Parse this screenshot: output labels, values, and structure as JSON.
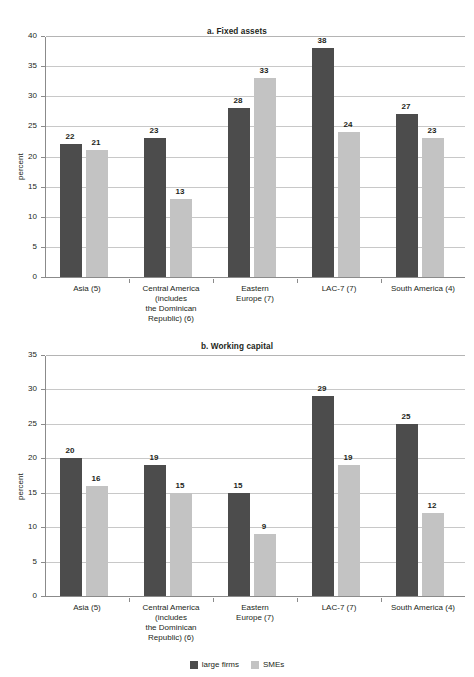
{
  "figure": {
    "panels": [
      {
        "id": "fixed-assets",
        "title": "a. Fixed assets",
        "ylabel": "percent"
      },
      {
        "id": "working-capital",
        "title": "b. Working capital",
        "ylabel": "percent"
      }
    ],
    "legend": {
      "items": [
        {
          "key": "large",
          "label": "large firms",
          "color": "#4c4c4c"
        },
        {
          "key": "sme",
          "label": "SMEs",
          "color": "#c3c3c3"
        }
      ]
    }
  },
  "chart_data": [
    {
      "type": "bar",
      "title": "a. Fixed assets",
      "xlabel": "",
      "ylabel": "percent",
      "ylim": [
        0,
        40
      ],
      "yticks": [
        0,
        5,
        10,
        15,
        20,
        25,
        30,
        35,
        40
      ],
      "grid": true,
      "legend_position": "bottom",
      "categories": [
        "Asia (5)",
        "Central America (includes the Dominican Republic) (6)",
        "Eastern Europe (7)",
        "LAC-7 (7)",
        "South America (4)"
      ],
      "category_lines": [
        [
          "Asia (5)"
        ],
        [
          "Central America",
          "(includes",
          "the Dominican",
          "Republic) (6)"
        ],
        [
          "Eastern",
          "Europe (7)"
        ],
        [
          "LAC-7 (7)"
        ],
        [
          "South America (4)"
        ]
      ],
      "series": [
        {
          "name": "large firms",
          "color": "#4c4c4c",
          "values": [
            22,
            23,
            28,
            38,
            27
          ]
        },
        {
          "name": "SMEs",
          "color": "#c3c3c3",
          "values": [
            21,
            13,
            33,
            24,
            23
          ]
        }
      ]
    },
    {
      "type": "bar",
      "title": "b. Working capital",
      "xlabel": "",
      "ylabel": "percent",
      "ylim": [
        0,
        35
      ],
      "yticks": [
        0,
        5,
        10,
        15,
        20,
        25,
        30,
        35
      ],
      "grid": true,
      "legend_position": "bottom",
      "categories": [
        "Asia (5)",
        "Central America (includes the Dominican Republic) (6)",
        "Eastern Europe (7)",
        "LAC-7 (7)",
        "South America (4)"
      ],
      "category_lines": [
        [
          "Asia (5)"
        ],
        [
          "Central America",
          "(includes",
          "the Dominican",
          "Republic) (6)"
        ],
        [
          "Eastern",
          "Europe (7)"
        ],
        [
          "LAC-7 (7)"
        ],
        [
          "South America (4)"
        ]
      ],
      "series": [
        {
          "name": "large firms",
          "color": "#4c4c4c",
          "values": [
            20,
            19,
            15,
            29,
            25
          ]
        },
        {
          "name": "SMEs",
          "color": "#c3c3c3",
          "values": [
            16,
            15,
            9,
            19,
            12
          ]
        }
      ]
    }
  ]
}
